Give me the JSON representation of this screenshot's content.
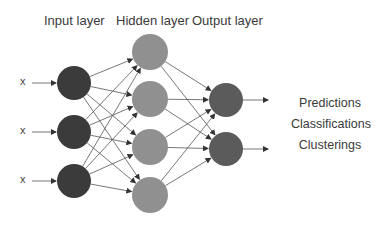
{
  "diagram": {
    "type": "neural-network",
    "layer_labels": {
      "input": "Input layer",
      "hidden": "Hidden layer",
      "output": "Output layer"
    },
    "input_symbols": [
      "x",
      "x",
      "x"
    ],
    "outputs": [
      "Predictions",
      "Classifications",
      "Clusterings"
    ],
    "layers": [
      {
        "name": "input",
        "color": "#3b3b3b",
        "r": 17,
        "cx": 74,
        "nodes_y": [
          83,
          132,
          181
        ]
      },
      {
        "name": "hidden",
        "color": "#909090",
        "r": 18,
        "cx": 150,
        "nodes_y": [
          52,
          99,
          147,
          195
        ]
      },
      {
        "name": "output",
        "color": "#5b5b5b",
        "r": 17,
        "cx": 226,
        "nodes_y": [
          100,
          149
        ]
      }
    ],
    "edge_color": "#555555"
  }
}
